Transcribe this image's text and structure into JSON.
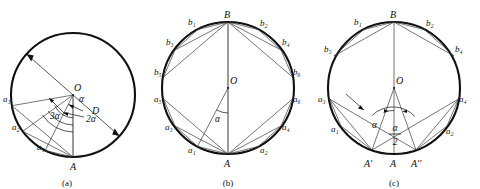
{
  "figure": {
    "background_color": "#ffffff",
    "stroke_color": "#111111",
    "panels": [
      {
        "id": "a",
        "caption": "(a)",
        "center_label": "O",
        "bottom_point_label": "A",
        "diameter_label": "D",
        "angle_labels": [
          "α",
          "2α",
          "3α"
        ],
        "point_labels": [
          "a₁",
          "a₂",
          "a₃"
        ]
      },
      {
        "id": "b",
        "caption": "(b)",
        "center_label": "O",
        "top_point_label": "B",
        "bottom_point_label": "A",
        "angle_labels": [
          "α"
        ],
        "point_labels_a": [
          "a₁",
          "a₂",
          "a₃",
          "a₄",
          "a₅",
          "a₆"
        ],
        "point_labels_b": [
          "b₁",
          "b₂",
          "b₃",
          "b₄",
          "b₅",
          "b₆"
        ]
      },
      {
        "id": "c",
        "caption": "(c)",
        "center_label": "O",
        "top_point_label": "B",
        "bottom_point_labels": [
          "A'",
          "A",
          "A''"
        ],
        "angle_labels": [
          "α"
        ],
        "half_angle_numerator": "α",
        "half_angle_denominator": "2",
        "point_labels_a": [
          "a₁",
          "a₂",
          "a₃",
          "a₄"
        ],
        "point_labels_b": [
          "b₁",
          "b₂",
          "b₃",
          "b₄"
        ]
      }
    ]
  }
}
